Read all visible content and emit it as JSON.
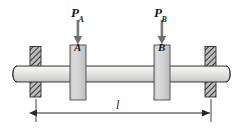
{
  "figure": {
    "name": "shaft-with-two-collars-diagram",
    "type": "engineering-mechanics-free-body-diagram",
    "background_color": "#ffffff",
    "width": 242,
    "height": 130
  },
  "labels": {
    "force_a": {
      "symbol": "P",
      "subscript": "A",
      "text": "P"
    },
    "force_b": {
      "symbol": "P",
      "subscript": "B",
      "text": "P"
    },
    "collar_a": "A",
    "collar_b": "B",
    "length": "l"
  },
  "colors": {
    "outline": "#1a1a1a",
    "shaft_light": "#f2f2f0",
    "shaft_mid": "#dedede",
    "shaft_dark": "#b8b8b8",
    "collar_fill": "#d0d0d0",
    "collar_edge": "#9a9a9a",
    "hatch_fill": "#b0b0b0",
    "hatch_line": "#3a3a3a",
    "arrow": "#6e6e6e",
    "dimension": "#2a2a2a"
  },
  "elements": {
    "shaft": {
      "x1": 12,
      "x2": 230,
      "y_top": 66,
      "y_bottom": 82,
      "end_caps": "rounded"
    },
    "support_left": {
      "x": 30,
      "y_top": 46,
      "y_bottom": 97,
      "width": 11,
      "style": "diagonal-hatch"
    },
    "support_right": {
      "x": 205,
      "y_top": 46,
      "y_bottom": 97,
      "width": 11,
      "style": "diagonal-hatch"
    },
    "collar_a": {
      "x": 70,
      "y_top": 45,
      "width": 16,
      "height": 55
    },
    "collar_b": {
      "x": 154,
      "y_top": 45,
      "width": 16,
      "height": 55
    },
    "arrow_a": {
      "x": 78,
      "y_start": 20,
      "y_end": 44,
      "direction": "down"
    },
    "arrow_b": {
      "x": 162,
      "y_start": 20,
      "y_end": 44,
      "direction": "down"
    },
    "dimension_line": {
      "x1": 36,
      "x2": 211,
      "y": 113,
      "arrows": "both-ends"
    },
    "extension_left": {
      "x": 36,
      "y_top": 99,
      "y_bottom": 122
    },
    "extension_right": {
      "x": 211,
      "y_top": 99,
      "y_bottom": 122
    }
  }
}
